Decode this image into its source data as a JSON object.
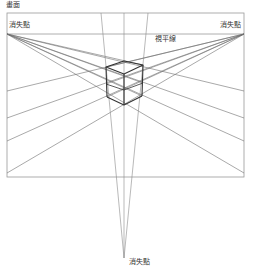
{
  "diagram": {
    "title": "畫面",
    "labels": {
      "vanishing_point_left": "消失點",
      "vanishing_point_right": "消失點",
      "vanishing_point_bottom": "消失點",
      "horizon_line": "視平線"
    },
    "colors": {
      "frame": "#999999",
      "guide_lines": "#777777",
      "cube_edges": "#333333",
      "text": "#333333"
    }
  }
}
